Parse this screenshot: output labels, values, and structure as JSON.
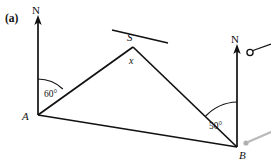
{
  "figure": {
    "part_label": "(a)",
    "labels": {
      "north_left": "N",
      "north_right": "N",
      "point_a": "A",
      "point_b": "B",
      "point_s": "S",
      "unknown_angle": "x",
      "angle_at_a": "60°",
      "angle_at_b": "50°"
    },
    "icons": {
      "north_arrow_left": "north-arrow-icon",
      "north_arrow_right": "north-arrow-icon",
      "open_circle_marker": "open-circle-marker-icon",
      "cursor_pointer": "cursor-pointer-icon"
    },
    "colors": {
      "ink": "#111111",
      "background": "#ffffff",
      "cursor_gray": "#b9b9b9"
    },
    "geometry": {
      "point_a": [
        38,
        115
      ],
      "point_b": [
        237,
        147
      ],
      "point_s": [
        133,
        47
      ],
      "north_left_top": [
        38,
        18
      ],
      "north_right_top": [
        237,
        47
      ],
      "transversal_start": [
        112,
        30
      ],
      "transversal_end": [
        168,
        43
      ]
    }
  }
}
